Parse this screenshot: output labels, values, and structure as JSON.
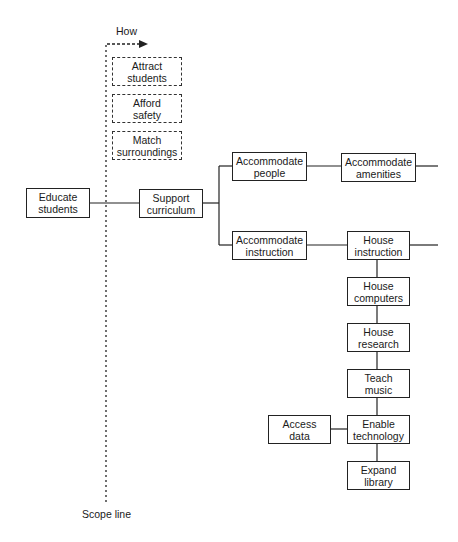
{
  "diagram": {
    "how_label": "How",
    "scope_label": "Scope line",
    "how_questions": [
      {
        "text": "Attract\nstudents"
      },
      {
        "text": "Afford\nsafety"
      },
      {
        "text": "Match\nsurroundings"
      }
    ],
    "nodes": {
      "educate_students": "Educate\nstudents",
      "support_curriculum": "Support\ncurriculum",
      "accommodate_people": "Accommodate\npeople",
      "accommodate_amenities": "Accommodate\namenities",
      "accommodate_instruction": "Accommodate\ninstruction",
      "house_instruction": "House\ninstruction",
      "house_computers": "House\ncomputers",
      "house_research": "House\nresearch",
      "teach_music": "Teach\nmusic",
      "enable_technology": "Enable\ntechnology",
      "access_data": "Access\ndata",
      "expand_library": "Expand\nlibrary"
    },
    "colors": {
      "line": "#222222",
      "background": "#ffffff"
    }
  }
}
